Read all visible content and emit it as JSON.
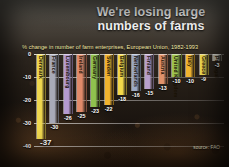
{
  "title": "We're losing large\nnumbers of farms",
  "subtitle": "% change in number of farm enterprises, European Union, 1982-1993",
  "source": "source: FAO",
  "first_value_label": "-37",
  "colors": {
    "denmark": "#f0d84f",
    "france": "#a8aab8",
    "luxembourg": "#b49ad0",
    "ireland": "#e08a6a",
    "germany": "#8fc24e",
    "sweden": "#f0b22e",
    "belgium": "#f2d84a",
    "netherlands": "#9aa8c4",
    "finland": "#b8a0cc",
    "austria": "#e0926a",
    "united_kingdom": "#9ec44e",
    "italy": "#f0b430",
    "greece": "#f2dc52",
    "portugal": "#b9b5a4"
  },
  "chart_data": {
    "type": "bar",
    "title": "We're losing large numbers of farms",
    "subtitle": "% change in number of farm enterprises, European Union, 1982-1993",
    "xlabel": "",
    "ylabel": "% change",
    "ylim": [
      -40,
      0
    ],
    "yticks": [
      "0",
      "-10",
      "-20",
      "-30",
      "-40"
    ],
    "ytick_values": [
      0,
      -10,
      -20,
      -30,
      -40
    ],
    "grid": true,
    "legend": false,
    "categories": [
      "Denmark",
      "France",
      "Luxembourg",
      "Ireland",
      "Germany",
      "Sweden",
      "Belgium",
      "Netherlands",
      "Finland",
      "Austria",
      "United Kingdom",
      "Italy",
      "Greece",
      "Portugal"
    ],
    "values": [
      -37,
      -30,
      -26,
      -25,
      -23,
      -22,
      -18,
      -16,
      -15,
      -13,
      -10,
      -10,
      -9,
      -3
    ],
    "value_labels": [
      "-37",
      "-30",
      "-26",
      "-25",
      "-23",
      "-22",
      "-18",
      "-16",
      "-15",
      "-13",
      "-10",
      "-10",
      "-9",
      "-3"
    ]
  }
}
